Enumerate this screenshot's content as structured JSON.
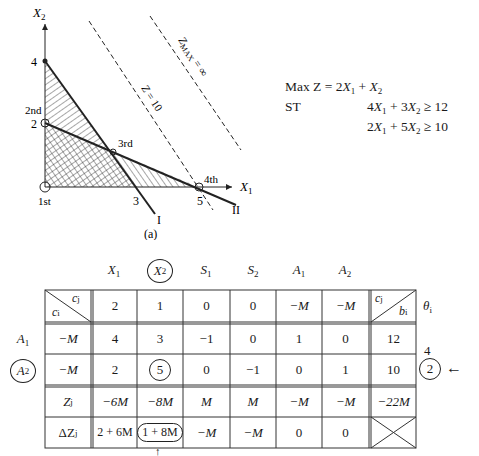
{
  "figure": {
    "caption": "(a)",
    "axes": {
      "x_label": "X",
      "x_sub": "1",
      "y_label": "X",
      "y_sub": "2",
      "x_ticks": [
        "3",
        "5"
      ],
      "y_ticks": [
        "4",
        "2"
      ]
    },
    "points": [
      {
        "label": "1st",
        "x": 0,
        "y": 0
      },
      {
        "label": "2nd",
        "x": 0,
        "y": 2
      },
      {
        "label": "3rd",
        "x": 2.14,
        "y": 1.14
      },
      {
        "label": "4th",
        "x": 5,
        "y": 0
      }
    ],
    "lines": [
      {
        "label": "I",
        "equation": "4X1 + 3X2 = 12"
      },
      {
        "label": "II",
        "equation": "2X1 + 5X2 = 10"
      }
    ],
    "objective_lines": [
      {
        "label": "Z = 10"
      },
      {
        "label": "Z",
        "sub": "MAX",
        "suffix": " = ∞"
      }
    ]
  },
  "problem": {
    "objective_label": "Max Z =",
    "objective": {
      "a": "2",
      "v1": "X",
      "s1": "1",
      "op": "+",
      "v2": "X",
      "s2": "2"
    },
    "st_label": "ST",
    "constraints": [
      {
        "c1": "4",
        "v1": "X",
        "s1": "1",
        "op": "+",
        "c2": "3",
        "v2": "X",
        "s2": "2",
        "rel": "≥",
        "rhs": "12"
      },
      {
        "c1": "2",
        "v1": "X",
        "s1": "1",
        "op": "+",
        "c2": "5",
        "v2": "X",
        "s2": "2",
        "rel": "≥",
        "rhs": "10"
      }
    ]
  },
  "tableau": {
    "columns": [
      {
        "v": "X",
        "s": "1",
        "circled": false
      },
      {
        "v": "X",
        "s": "2",
        "circled": true
      },
      {
        "v": "S",
        "s": "1",
        "circled": false
      },
      {
        "v": "S",
        "s": "2",
        "circled": false
      },
      {
        "v": "A",
        "s": "1",
        "circled": false
      },
      {
        "v": "A",
        "s": "2",
        "circled": false
      }
    ],
    "corner": {
      "top": "c",
      "top_sub": "j",
      "bottom": "c",
      "bottom_sub": "i"
    },
    "rhs_corner": {
      "top": "c",
      "top_sub": "j",
      "bottom": "b",
      "bottom_sub": "i"
    },
    "theta_header": {
      "v": "θ",
      "s": "i"
    },
    "cj_row": [
      "2",
      "1",
      "0",
      "0",
      "−M",
      "−M"
    ],
    "rows": [
      {
        "basis": {
          "v": "A",
          "s": "1",
          "circled": false
        },
        "ci": "−M",
        "values": [
          "4",
          "3",
          "−1",
          "0",
          "1",
          "0"
        ],
        "b": "12",
        "theta": "4",
        "theta_circled": false,
        "arrow": ""
      },
      {
        "basis": {
          "v": "A",
          "s": "2",
          "circled": true
        },
        "ci": "−M",
        "values": [
          "2",
          "5",
          "0",
          "−1",
          "0",
          "1"
        ],
        "b": "10",
        "theta": "2",
        "theta_circled": true,
        "arrow": "←"
      }
    ],
    "zj_row": {
      "label": "Z",
      "sub": "j",
      "values": [
        "−6M",
        "−8M",
        "M",
        "M",
        "−M",
        "−M"
      ],
      "b": "−22M"
    },
    "dzj_row": {
      "label": "ΔZ",
      "sub": "j",
      "values": [
        "2 + 6M",
        "1 + 8M",
        "−M",
        "−M",
        "0",
        "0"
      ],
      "circled_index": 1
    },
    "entering_arrow": "↑"
  }
}
